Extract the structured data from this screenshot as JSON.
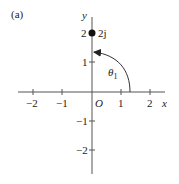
{
  "figure": {
    "panel_label": "(a)",
    "axes": {
      "x_label": "x",
      "y_label": "y",
      "origin_label": "O",
      "x_ticks": [
        "−2",
        "−1",
        "1",
        "2"
      ],
      "y_ticks": [
        "2",
        "1",
        "−1",
        "−2"
      ]
    },
    "point": {
      "label": "2j",
      "x": 0,
      "y": 2
    },
    "angle": {
      "label": "θ",
      "subscript": "1"
    },
    "colors": {
      "line": "#555555",
      "text": "#222222",
      "point": "#111111"
    }
  }
}
